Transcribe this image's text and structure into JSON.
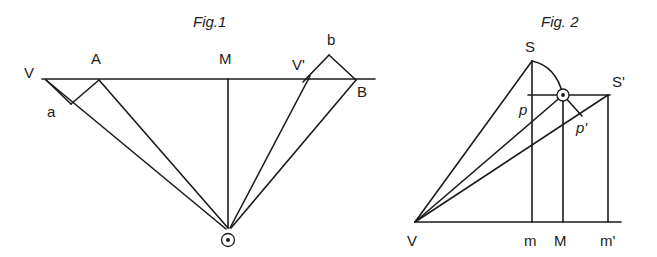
{
  "page": {
    "background_color": "#ffffff",
    "ink_color": "#1b1b1b",
    "width": 657,
    "height": 257
  },
  "figures": [
    {
      "id": "fig-1",
      "title": "Fig.1",
      "title_x": 193,
      "title_y": 27,
      "description": "Horizontal baseline VB with points V, A, M, V', B; apex point a below left, apex point b above right; rays converging downward at the sun symbol.",
      "baseline": {
        "x1": 42,
        "y1": 79,
        "x2": 341,
        "y2": 79
      },
      "sun": {
        "cx": 228,
        "cy": 240,
        "r_outer": 6.5,
        "r_inner": 2.0,
        "symbol": "sun-circle-dot"
      },
      "converge": {
        "x": 228,
        "y": 228
      },
      "points": [
        {
          "key": "V",
          "label": "V",
          "x": 46,
          "y": 79,
          "label_x": 24,
          "label_y": 78,
          "italic": false
        },
        {
          "key": "A",
          "label": "A",
          "x": 99,
          "y": 79,
          "label_x": 91,
          "label_y": 64,
          "italic": false
        },
        {
          "key": "a",
          "label": "a",
          "x": 71,
          "y": 103,
          "label_x": 47,
          "label_y": 117,
          "italic": false
        },
        {
          "key": "M",
          "label": "M",
          "x": 228,
          "y": 79,
          "label_x": 219,
          "label_y": 64,
          "italic": false
        },
        {
          "key": "Vp",
          "label": "V'",
          "x": 305,
          "y": 79,
          "label_x": 292,
          "label_y": 70,
          "italic": false
        },
        {
          "key": "b",
          "label": "b",
          "x": 329,
          "y": 53,
          "label_x": 327,
          "label_y": 45,
          "italic": false
        },
        {
          "key": "B",
          "label": "B",
          "x": 355,
          "y": 79,
          "label_x": 357,
          "label_y": 97,
          "italic": false
        }
      ],
      "segments": [
        {
          "name": "baseline-V-to-right-end",
          "d": "M 42 79 L 375 79"
        },
        {
          "name": "V-to-a",
          "d": "M 46 80 L 71 104"
        },
        {
          "name": "a-to-A",
          "d": "M 71 104 L 99 80"
        },
        {
          "name": "A-to-sun",
          "d": "M 99 80 L 228 228"
        },
        {
          "name": "V-to-sun",
          "d": "M 46 80 L 226 229"
        },
        {
          "name": "M-vertical",
          "d": "M 228 79 L 228 228"
        },
        {
          "name": "Vprime-to-b",
          "d": "M 303 82 L 329 55"
        },
        {
          "name": "b-to-B",
          "d": "M 329 55 L 356 80"
        },
        {
          "name": "Vprime-ray-to-sun",
          "d": "M 310 76 L 230 228"
        },
        {
          "name": "B-ray-to-sun",
          "d": "M 356 80 L 231 228"
        }
      ]
    },
    {
      "id": "fig-2",
      "title": "Fig. 2",
      "title_x": 541,
      "title_y": 27,
      "description": "Right-triangle construction from apex V along baseline V m M m'; verticals at m, M and m'; S atop m, S' atop m'; horizontal chord p to S' through the sun symbol; arc from S to the sun symbol; short segment to p'.",
      "baseline": {
        "x1": 415,
        "y1": 222,
        "x2": 621,
        "y2": 222
      },
      "sun": {
        "cx": 563,
        "cy": 95,
        "r_outer": 6.0,
        "r_inner": 1.9,
        "symbol": "sun-circle-dot"
      },
      "points": [
        {
          "key": "V",
          "label": "V",
          "x": 415,
          "y": 222,
          "label_x": 407,
          "label_y": 246,
          "italic": false
        },
        {
          "key": "m",
          "label": "m",
          "x": 532,
          "y": 222,
          "label_x": 524,
          "label_y": 246,
          "italic": false
        },
        {
          "key": "M",
          "label": "M",
          "x": 563,
          "y": 222,
          "label_x": 554,
          "label_y": 246,
          "italic": false
        },
        {
          "key": "mp",
          "label": "m'",
          "x": 608,
          "y": 222,
          "label_x": 600,
          "label_y": 246,
          "italic": false
        },
        {
          "key": "S",
          "label": "S",
          "x": 532,
          "y": 61,
          "label_x": 525,
          "label_y": 52,
          "italic": false
        },
        {
          "key": "Sp",
          "label": "S'",
          "x": 608,
          "y": 95,
          "label_x": 612,
          "label_y": 87,
          "italic": false
        },
        {
          "key": "p",
          "label": "p",
          "x": 532,
          "y": 95,
          "label_x": 519,
          "label_y": 115,
          "italic": true
        },
        {
          "key": "pp",
          "label": "p'",
          "x": 578,
          "y": 114,
          "label_x": 576,
          "label_y": 133,
          "italic": true
        }
      ],
      "segments": [
        {
          "name": "baseline-V-to-mprime",
          "d": "M 415 222 L 621 222"
        },
        {
          "name": "V-to-S",
          "d": "M 415 222 L 532 61"
        },
        {
          "name": "V-to-sun",
          "d": "M 415 222 L 563 95"
        },
        {
          "name": "V-to-Sprime",
          "d": "M 415 222 L 608 95"
        },
        {
          "name": "m-vertical",
          "d": "M 532 61 L 532 222"
        },
        {
          "name": "M-vertical",
          "d": "M 563 95 L 563 222"
        },
        {
          "name": "mprime-vertical",
          "d": "M 608 95 L 608 222"
        },
        {
          "name": "chord-p-to-Sprime",
          "d": "M 528 95 L 610 95"
        },
        {
          "name": "sun-to-pprime",
          "d": "M 563 95 L 582 116"
        }
      ],
      "arcs": [
        {
          "name": "arc-S-to-sun",
          "d": "M 532 61 Q 556 66 563 95"
        }
      ]
    }
  ]
}
